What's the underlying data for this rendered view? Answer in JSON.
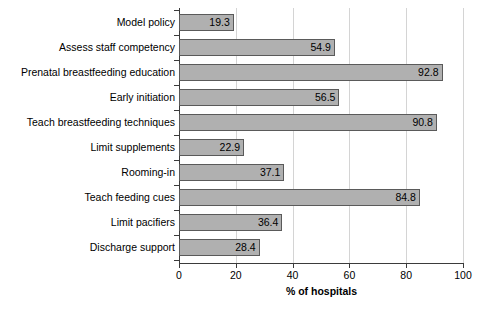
{
  "chart_data": {
    "type": "bar",
    "orientation": "horizontal",
    "title": "",
    "xlabel": "% of hospitals",
    "ylabel": "",
    "xlim": [
      0,
      100
    ],
    "xticks": [
      0,
      20,
      40,
      60,
      80,
      100
    ],
    "grid": "vertical",
    "legend": "none",
    "categories": [
      "Model policy",
      "Assess staff competency",
      "Prenatal breastfeeding education",
      "Early initiation",
      "Teach breastfeeding techniques",
      "Limit supplements",
      "Rooming-in",
      "Teach feeding cues",
      "Limit pacifiers",
      "Discharge support"
    ],
    "values": [
      19.3,
      54.9,
      92.8,
      56.5,
      90.8,
      22.9,
      37.1,
      84.8,
      36.4,
      28.4
    ],
    "value_labels": [
      "19.3",
      "54.9",
      "92.8",
      "56.5",
      "90.8",
      "22.9",
      "37.1",
      "84.8",
      "36.4",
      "28.4"
    ],
    "tick_labels": [
      "0",
      "20",
      "40",
      "60",
      "80",
      "100"
    ],
    "colors": {
      "bar_fill": "#b0b0b0",
      "bar_border": "#5a5a5a",
      "gridline": "#d4d4d4",
      "axis": "#3b3b3b",
      "text": "#000000",
      "background": "#ffffff"
    }
  }
}
